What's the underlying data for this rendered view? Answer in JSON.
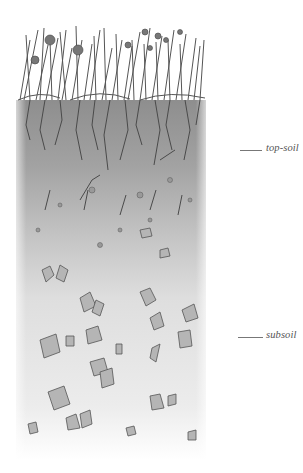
{
  "diagram": {
    "type": "soil-profile-cross-section",
    "layers": [
      {
        "name": "vegetation",
        "description": "grasses, clover and flowering plants at surface"
      },
      {
        "name": "top-soil",
        "description": "dark layer with dense roots and small stones"
      },
      {
        "name": "subsoil",
        "description": "lighter sandy layer with larger angular stones"
      }
    ],
    "labels": {
      "topsoil": "top-soil",
      "subsoil": "subsoil"
    },
    "colors": {
      "topsoil": "#9a9a9a",
      "subsoil": "#d8d8d8",
      "stones": "#b5b5b5",
      "outline": "#555555"
    }
  }
}
